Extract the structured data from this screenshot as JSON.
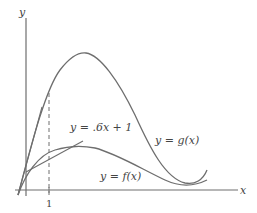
{
  "diagram": {
    "axes": {
      "x_label": "x",
      "y_label": "y",
      "tick_label_x": "1"
    },
    "curves": [
      {
        "name": "g",
        "label": "y = g(x)"
      },
      {
        "name": "f",
        "label": "y = f(x)"
      }
    ],
    "tangent_line": {
      "label": "y = .6x + 1"
    },
    "colors": {
      "curve": "#6e6e6e",
      "axis": "#6e6e6e",
      "text": "#444444"
    }
  }
}
